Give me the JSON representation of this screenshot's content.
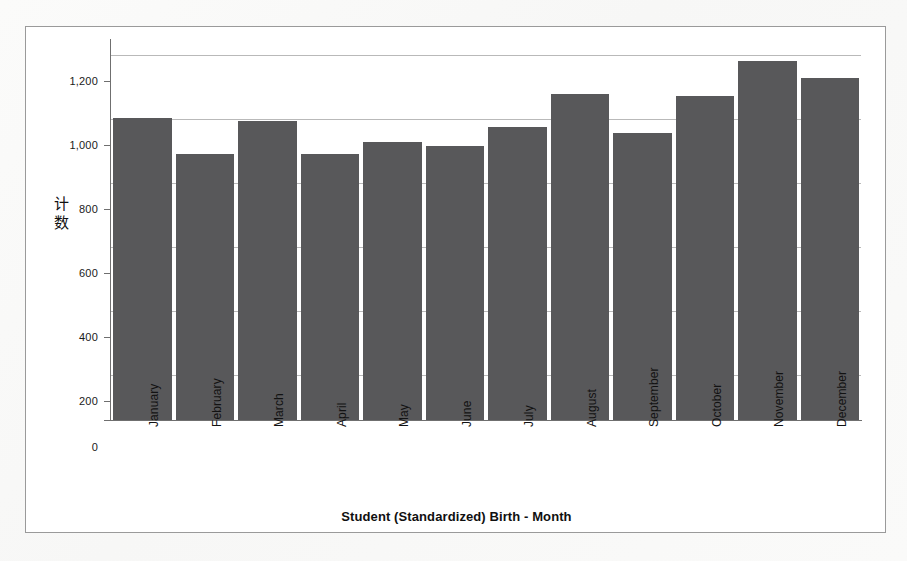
{
  "chart_data": {
    "type": "bar",
    "title": "",
    "xlabel": "Student (Standardized) Birth - Month",
    "ylabel": "计数",
    "categories": [
      "January",
      "February",
      "March",
      "April",
      "May",
      "June",
      "July",
      "August",
      "September",
      "October",
      "November",
      "December"
    ],
    "values": [
      1015,
      895,
      1005,
      893,
      933,
      920,
      985,
      1095,
      965,
      1088,
      1205,
      1148
    ],
    "ylim": [
      0,
      1280
    ],
    "yticks": [
      0,
      200,
      400,
      600,
      800,
      1000,
      1200
    ],
    "ytick_labels": [
      "0",
      "200",
      "400",
      "600",
      "800",
      "1,000",
      "1,200"
    ],
    "grid": true,
    "legend": "none",
    "bar_color": "#58585a",
    "gridline_color": "#b9b9b9",
    "axis_color": "#6f6f6f",
    "background_color": "#ffffff"
  },
  "figure": {
    "border_color": "#9a9a9a"
  }
}
